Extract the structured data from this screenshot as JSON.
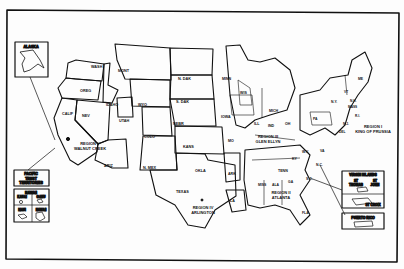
{
  "map": {
    "colors": {
      "ink": "#111111",
      "paper": "#fdfdfd"
    },
    "insets": {
      "alaska": "ALASKA",
      "pacific": [
        "PACIFIC",
        "TRUST",
        "TERRITORIES"
      ],
      "hawaii": {
        "title": "HAWAII",
        "kauai": "KAUAI",
        "oahu": "OAHU",
        "maui": "MAUI",
        "hawaii": "HAWAII"
      },
      "virgin_islands": {
        "title": "VIRGIN ISLANDS",
        "st_thomas": [
          "ST",
          "THOMAS"
        ],
        "st_john": [
          "ST",
          "JOHN"
        ],
        "st_croix": "ST CROIX"
      },
      "puerto_rico": "PUERTO RICO"
    },
    "states": {
      "wash": "WASH",
      "oreg": "OREG",
      "calif": "CALIF",
      "nev": "NEV",
      "ariz": "ARIZ",
      "idaho": "IDAHO",
      "mont": "MONT",
      "wyo": "WYO",
      "utah": "UTAH",
      "colo": "COLO",
      "nmex": "N. MEX",
      "ndak": "N. DAK",
      "sdak": "S. DAK",
      "nebr": "NEBR",
      "kans": "KANS",
      "okla": "OKLA",
      "texas": "TEXAS",
      "minn": "MINN",
      "iowa": "IOWA",
      "mo": "MO",
      "ark": "ARK",
      "la": "LA",
      "wis": "WIS",
      "mich": "MICH",
      "ill": "ILL",
      "ind": "IND",
      "oh": "OH",
      "ky": "KY",
      "tenn": "TENN",
      "miss": "MISS",
      "ala": "ALA",
      "ga": "GA",
      "fla": "FLA",
      "sc": "S.C.",
      "nc": "N.C.",
      "va": "VA",
      "wva": "W.V.",
      "pa": "PA",
      "ny": "N.Y.",
      "vt": "VT",
      "nh": "N.H.",
      "me": "ME",
      "mass": "MASS",
      "conn": "CT",
      "ri": "R.I.",
      "nj": "N.J.",
      "del": "DEL",
      "md": "MD"
    },
    "regions": {
      "r1": [
        "REGION I",
        "KING OF PRUSSIA"
      ],
      "r3": [
        "REGION III",
        "GLEN ELLYN"
      ],
      "r2": [
        "REGION II",
        "ATLANTA"
      ],
      "r4": [
        "REGION IV",
        "ARLINGTON"
      ],
      "r5": [
        "REGION V",
        "WALNUT CREEK"
      ]
    }
  }
}
